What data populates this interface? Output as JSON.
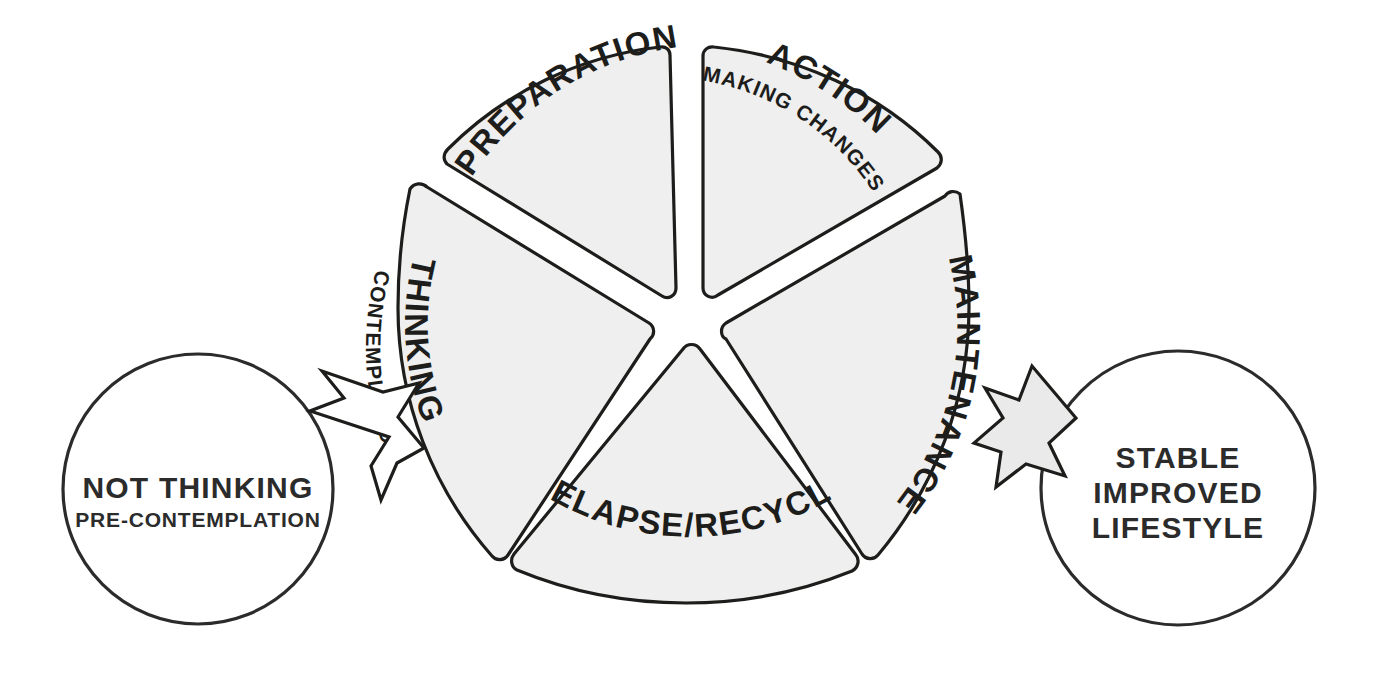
{
  "diagram": {
    "colors": {
      "segment_fill": "#efefef",
      "segment_stroke": "#1d1d1b",
      "circle_stroke": "#2b2b2b",
      "arrow_left_fill": "#ffffff",
      "arrow_right_fill": "#eaeaea",
      "background": "#ffffff",
      "text": "#1d1d1b"
    },
    "wheel": {
      "center_x": 689,
      "center_y": 325,
      "outer_radius": 291,
      "segment_count": 5,
      "segments": [
        {
          "id": "preparation",
          "label": "PREPARATION",
          "sublabel": "",
          "start_angle_deg": -90,
          "end_angle_deg": -162
        },
        {
          "id": "action",
          "label": "ACTION",
          "sublabel": "MAKING CHANGES",
          "start_angle_deg": -90,
          "end_angle_deg": -18
        },
        {
          "id": "maintenance",
          "label": "MAINTENANCE",
          "sublabel": "",
          "start_angle_deg": -18,
          "end_angle_deg": 54
        },
        {
          "id": "relapse-recycle",
          "label": "RELAPSE/RECYCLE",
          "sublabel": "",
          "start_angle_deg": 54,
          "end_angle_deg": 126
        },
        {
          "id": "thinking",
          "label": "THINKING",
          "sublabel": "CONTEMPLATION",
          "start_angle_deg": 126,
          "end_angle_deg": 198
        }
      ]
    },
    "circles": [
      {
        "id": "not-thinking",
        "title": "NOT THINKING",
        "sublabel": "PRE-CONTEMPLATION",
        "cx": 198,
        "cy": 489,
        "r": 135
      },
      {
        "id": "stable-improved-lifestyle",
        "title_lines": [
          "STABLE",
          "IMPROVED",
          "LIFESTYLE"
        ],
        "line1": "STABLE",
        "line2": "IMPROVED",
        "line3": "LIFESTYLE",
        "cx": 1178,
        "cy": 488,
        "r": 137
      }
    ],
    "arrows": [
      {
        "id": "entry-arrow",
        "name": "arrow-right-icon",
        "direction": "right",
        "fill": "#ffffff",
        "from": "not-thinking",
        "to": "thinking"
      },
      {
        "id": "exit-arrow",
        "name": "arrow-right-icon",
        "direction": "right",
        "fill": "#eaeaea",
        "from": "maintenance",
        "to": "stable-improved-lifestyle"
      }
    ]
  }
}
